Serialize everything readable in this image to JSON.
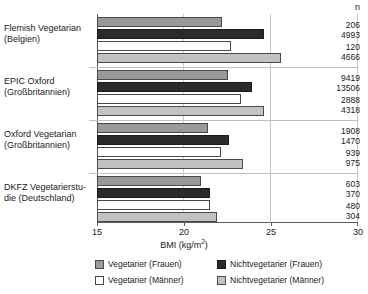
{
  "chart_data": {
    "type": "bar",
    "orientation": "horizontal",
    "title": "",
    "xlabel": "BMI (kg/m2)",
    "ylabel": "",
    "xlim": [
      15,
      30
    ],
    "xticks": [
      15,
      20,
      25,
      30
    ],
    "xtick_labels": [
      "15",
      "20",
      "25",
      "30"
    ],
    "grid": true,
    "grid_axis": "x",
    "legend_position": "bottom",
    "categories": [
      "Flemish Vegetarian (Belgien)",
      "EPIC Oxford (Großbritannien)",
      "Oxford Vegetarian (Großbritannien)",
      "DKFZ Vegetarierstudie (Deutschland)"
    ],
    "series": [
      {
        "name": "Vegetarier (Frauen)",
        "key": "veg-f",
        "color": "#9a9a9a",
        "values": [
          22.2,
          22.5,
          21.4,
          21.0
        ]
      },
      {
        "name": "Nichtvegetarier (Frauen)",
        "key": "nonveg-f",
        "color": "#2b2b2b",
        "values": [
          24.6,
          23.9,
          22.6,
          21.5
        ]
      },
      {
        "name": "Vegetarier (Männer)",
        "key": "veg-m",
        "color": "#ffffff",
        "values": [
          22.7,
          23.3,
          22.1,
          21.5
        ]
      },
      {
        "name": "Nichtvegetarier (Männer)",
        "key": "nonveg-m",
        "color": "#c2c2c2",
        "values": [
          25.6,
          24.6,
          23.4,
          21.9
        ]
      }
    ],
    "n_header": "n",
    "n_values": [
      [
        "206",
        "4993",
        "120",
        "4666"
      ],
      [
        "9419",
        "13506",
        "2888",
        "4318"
      ],
      [
        "1908",
        "1470",
        "939",
        "975"
      ],
      [
        "603",
        "370",
        "480",
        "304"
      ]
    ]
  },
  "axis": {
    "x_title_main": "BMI (kg/m",
    "x_title_sup": "2",
    "x_title_end": ")",
    "ticks": [
      {
        "label": "15"
      },
      {
        "label": "20"
      },
      {
        "label": "25"
      },
      {
        "label": "30"
      }
    ]
  },
  "categories": [
    {
      "line1": "Flemish Vegetarian",
      "line2": "(Belgien)"
    },
    {
      "line1": "EPIC Oxford",
      "line2": "(Großbritannien)"
    },
    {
      "line1": "Oxford Vegetarian",
      "line2": "(Großbritannien)"
    },
    {
      "line1": "DKFZ Vegetarierstu-",
      "line2": "die (Deutschland)"
    }
  ],
  "n_column": {
    "header": "n",
    "groups": [
      {
        "v1": "206",
        "v2": "4993",
        "v3": "120",
        "v4": "4666"
      },
      {
        "v1": "9419",
        "v2": "13506",
        "v3": "2888",
        "v4": "4318"
      },
      {
        "v1": "1908",
        "v2": "1470",
        "v3": "939",
        "v4": "975"
      },
      {
        "v1": "603",
        "v2": "370",
        "v3": "480",
        "v4": "304"
      }
    ]
  },
  "legend": {
    "items": [
      {
        "label": "Vegetarier (Frauen)",
        "swatch": "veg-f"
      },
      {
        "label": "Nichtvegetarier (Frauen)",
        "swatch": "nonveg-f"
      },
      {
        "label": "Vegetarier (Männer)",
        "swatch": "veg-m"
      },
      {
        "label": "Nichtvegetarier (Männer)",
        "swatch": "nonveg-m"
      }
    ]
  },
  "colors": {
    "vegetarier_frauen": "#9a9a9a",
    "nichtvegetarier_frauen": "#2b2b2b",
    "vegetarier_maenner": "#ffffff",
    "nichtvegetarier_maenner": "#c2c2c2",
    "axis": "#5d5d5d",
    "grid": "#c9c9c9",
    "text": "#1a1a1a"
  }
}
